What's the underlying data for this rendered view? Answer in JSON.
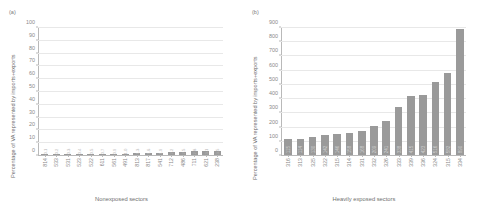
{
  "figure": {
    "panels": [
      {
        "tag": "(a)",
        "ytitle": "Percentage of VA represented by imports+exports",
        "xtitle": "Nonexposed sectors"
      },
      {
        "tag": "(b)",
        "ytitle": "Percentage of VA represented by imports+exports",
        "xtitle": "Heavily exposed sectors"
      }
    ]
  },
  "chart_data": [
    {
      "type": "bar",
      "title": "(a)",
      "xlabel": "Nonexposed sectors",
      "ylabel": "Percentage of VA represented by imports+exports",
      "ylim": [
        0,
        100
      ],
      "yticks": [
        0,
        10,
        20,
        30,
        40,
        50,
        60,
        70,
        80,
        90,
        100
      ],
      "grid": true,
      "legend": "none",
      "bar_color": "#9a9a9a",
      "categories": [
        "814",
        "533",
        "531",
        "523",
        "522",
        "611",
        "561",
        "491",
        "813",
        "817",
        "541",
        "712",
        "486",
        "711",
        "621",
        "238"
      ],
      "values": [
        0.1,
        0.2,
        0.3,
        0.4,
        0.5,
        0.7,
        0.9,
        1.0,
        1.3,
        1.6,
        1.9,
        2.2,
        2.5,
        2.8,
        3.1,
        3.5
      ],
      "value_labels": [
        "0.1",
        "0.2",
        "0.3",
        "0.4",
        "0.5",
        "0.7",
        "0.9",
        "1.0",
        "1.3",
        "1.6",
        "1.9",
        "2.2",
        "2.5",
        "2.8",
        "3.1",
        "3.5"
      ]
    },
    {
      "type": "bar",
      "title": "(b)",
      "xlabel": "Heavily exposed sectors",
      "ylabel": "Percentage of VA represented by imports+exports",
      "ylim": [
        0,
        900
      ],
      "yticks": [
        0,
        100,
        200,
        300,
        400,
        500,
        600,
        700,
        800,
        900
      ],
      "grid": true,
      "legend": "none",
      "bar_color": "#9a9a9a",
      "categories": [
        "316",
        "313",
        "325",
        "322",
        "315",
        "314",
        "331",
        "332",
        "326",
        "333",
        "339",
        "336",
        "324",
        "315",
        "334"
      ],
      "values": [
        115,
        114,
        130,
        142,
        146,
        158,
        168,
        209,
        241,
        338,
        415,
        423,
        516,
        582,
        890
      ],
      "value_labels": [
        "115",
        "114",
        "130",
        "142",
        "146",
        "158",
        "168",
        "209",
        "241",
        "338",
        "415",
        "423",
        "516",
        "582",
        "890"
      ]
    }
  ]
}
